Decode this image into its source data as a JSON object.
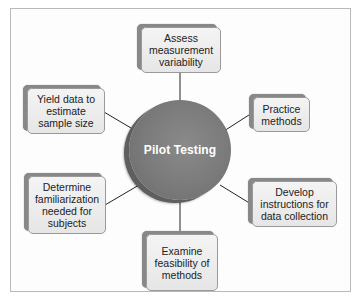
{
  "diagram": {
    "center": {
      "label": "Pilot Testing",
      "color": "#7a7a7a"
    },
    "nodes": [
      {
        "id": "assess",
        "label": "Assess\nmeasurement\nvariability"
      },
      {
        "id": "practice",
        "label": "Practice\nmethods"
      },
      {
        "id": "develop",
        "label": "Develop\ninstructions for\ndata collection"
      },
      {
        "id": "examine",
        "label": "Examine\nfeasibility of\nmethods"
      },
      {
        "id": "determine",
        "label": "Determine\nfamiliarization\nneeded for\nsubjects"
      },
      {
        "id": "yield",
        "label": "Yield data to\nestimate\nsample size"
      }
    ]
  }
}
